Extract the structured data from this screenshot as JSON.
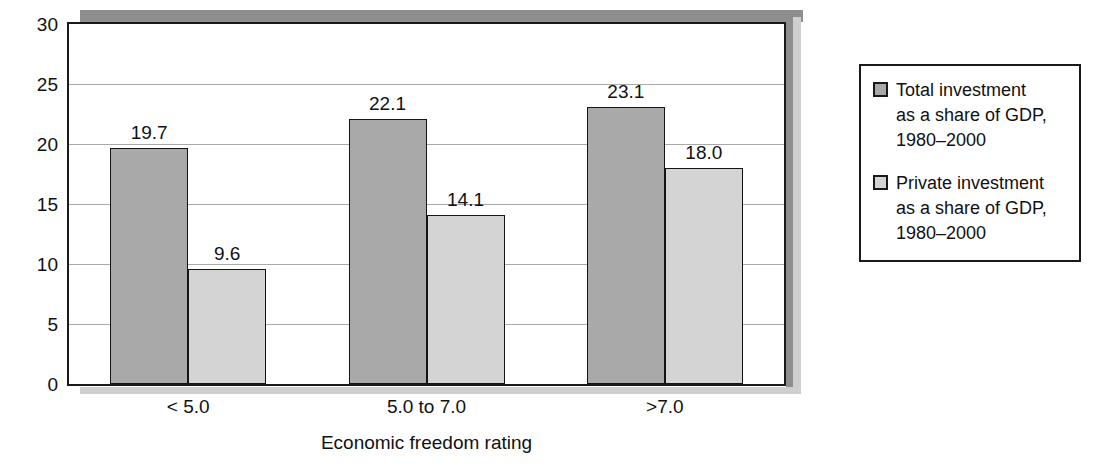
{
  "chart_data": {
    "type": "bar",
    "title": "",
    "subtitle": "",
    "xlabel": "Economic freedom rating",
    "ylabel": "",
    "categories": [
      "< 5.0",
      "5.0 to 7.0",
      ">7.0"
    ],
    "series": [
      {
        "name": "Total investment as a share of GDP, 1980–2000",
        "values": [
          19.7,
          22.1,
          23.1
        ],
        "labels": [
          "19.7",
          "22.1",
          "23.1"
        ],
        "color": "#a9a9a9"
      },
      {
        "name": "Private investment as a share of GDP, 1980–2000",
        "values": [
          9.6,
          14.1,
          18.0
        ],
        "labels": [
          "9.6",
          "14.1",
          "18.0"
        ],
        "color": "#d4d4d4"
      }
    ],
    "ylim": [
      0,
      30
    ],
    "yticks": [
      0,
      5,
      10,
      15,
      20,
      25,
      30
    ],
    "ytick_labels": [
      "0",
      "5",
      "10",
      "15",
      "20",
      "25",
      "30"
    ],
    "grid": "horizontal",
    "legend_position": "right"
  },
  "legend": {
    "entries": [
      {
        "swatch": "total-investment-swatch",
        "label": "Total investment\nas a share of GDP,\n1980–2000"
      },
      {
        "swatch": "private-investment-swatch",
        "label": "Private investment\nas a share of GDP,\n1980–2000"
      }
    ]
  },
  "axes": {
    "x_title": "Economic freedom rating",
    "x_tick_labels": [
      "< 5.0",
      "5.0 to 7.0",
      ">7.0"
    ],
    "y_tick_labels": [
      "30",
      "25",
      "20",
      "15",
      "10",
      "5",
      "0"
    ]
  },
  "colors": {
    "total_bar": "#a9a9a9",
    "private_bar": "#d4d4d4",
    "bar_border": "#141414",
    "gridline": "#a9a9a9",
    "axis": "#1a1a1a",
    "shadow": "#8e8e8e",
    "shadow_light": "#cfcfcf",
    "background": "#ffffff"
  }
}
